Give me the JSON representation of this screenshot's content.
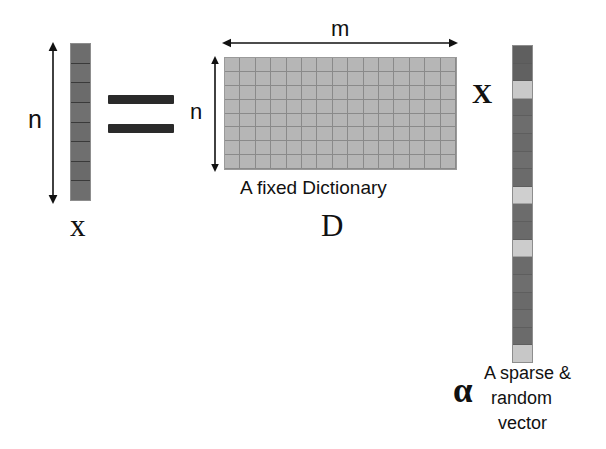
{
  "diagram": {
    "title_text": "Sparse coding equation diagram",
    "colors": {
      "vector_dark": "#6e6e6e",
      "vector_light": "#c9c9c9",
      "matrix_fill": "#b6b6b6",
      "grid_line": "#8a8a8a",
      "ink": "#111111"
    },
    "equals_sign": {
      "name": "equals-sign",
      "bars": 2
    },
    "multiply_sign": {
      "label": "X"
    },
    "left_vector": {
      "label": "x",
      "dimension_label": "n",
      "cells": 8,
      "cell_values": [
        "dark",
        "dark",
        "dark",
        "dark",
        "dark",
        "dark",
        "dark",
        "dark"
      ]
    },
    "dictionary": {
      "label": "D",
      "caption": "A fixed Dictionary",
      "rows_label": "n",
      "cols_label": "m",
      "rows": 8,
      "cols": 15
    },
    "right_vector": {
      "label": "α",
      "caption_line1": "A sparse &",
      "caption_line2": "random",
      "caption_line3": "vector",
      "cells": 18,
      "cell_values": [
        "dark",
        "dark",
        "light",
        "dark",
        "dark",
        "dark",
        "dark",
        "dark",
        "light",
        "dark",
        "dark",
        "light",
        "dark",
        "dark",
        "dark",
        "dark",
        "dark",
        "light"
      ]
    }
  }
}
